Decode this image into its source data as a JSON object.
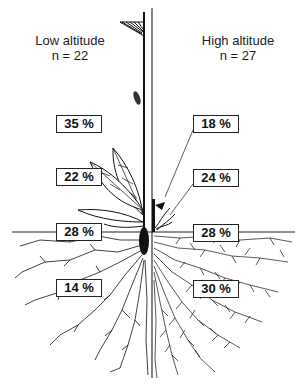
{
  "figure": {
    "type": "biomass allocation diagram (plant shoot and root)",
    "left": {
      "title": "Low altitude",
      "n_label": "n = 22",
      "allocations": [
        {
          "organ": "reproductive/upper shoot",
          "value": "35 %"
        },
        {
          "organ": "leaves",
          "value": "22 %"
        },
        {
          "organ": "stem base / rhizome",
          "value": "28 %"
        },
        {
          "organ": "roots",
          "value": "14 %"
        }
      ]
    },
    "right": {
      "title": "High altitude",
      "n_label": "n = 27",
      "allocations": [
        {
          "organ": "reproductive/upper shoot",
          "value": "18 %"
        },
        {
          "organ": "leaves",
          "value": "24 %"
        },
        {
          "organ": "stem base / rhizome",
          "value": "28 %"
        },
        {
          "organ": "roots",
          "value": "30 %"
        }
      ]
    },
    "colors": {
      "ink": "#111111",
      "background": "#ffffff"
    }
  }
}
